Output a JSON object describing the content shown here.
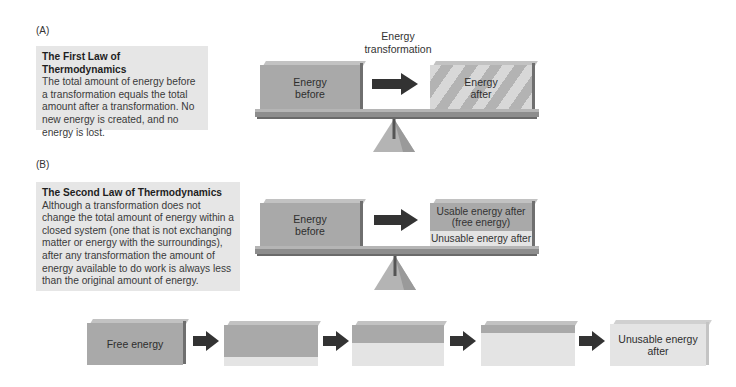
{
  "panel_a": {
    "label": "(A)",
    "law_title": "The First Law of Thermodynamics",
    "law_text": "The total amount of energy before a transformation equals the total amount after a transformation. No new energy is created, and no energy is lost.",
    "caption_line1": "Energy",
    "caption_line2": "transformation",
    "block_before": "Energy before",
    "block_before_l1": "Energy",
    "block_before_l2": "before",
    "block_after_l1": "Energy",
    "block_after_l2": "after"
  },
  "panel_b": {
    "label": "(B)",
    "law_title": "The Second Law of Thermodynamics",
    "law_text": "Although a transformation does not change the total amount of energy within a closed system (one that is not exchanging matter or energy with the surroundings), after any transformation the amount of energy available to do work is always less than the original amount of energy.",
    "block_before_l1": "Energy",
    "block_before_l2": "before",
    "usable_l1": "Usable energy after",
    "usable_l2": "(free energy)",
    "unusable": "Unusable energy after"
  },
  "sequence": {
    "first_label": "Free energy",
    "last_label": "Unusable energy after",
    "stages": [
      {
        "usable_pct": 100
      },
      {
        "usable_pct": 80
      },
      {
        "usable_pct": 45
      },
      {
        "usable_pct": 20
      },
      {
        "usable_pct": 0
      }
    ]
  },
  "colors": {
    "free_energy": "#a9a9a9",
    "unusable_energy": "#e4e4e4",
    "arrow": "#333333",
    "text_box_bg": "#e6e6e6"
  }
}
